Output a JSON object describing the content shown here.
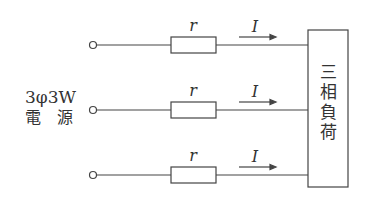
{
  "diagram": {
    "source_label_line1": "3φ3W",
    "source_label_line2": "電　源",
    "load_label": [
      "三",
      "相",
      "負",
      "荷"
    ],
    "lines": [
      {
        "resistor_label": "r",
        "current_label": "I"
      },
      {
        "resistor_label": "r",
        "current_label": "I"
      },
      {
        "resistor_label": "r",
        "current_label": "I"
      }
    ],
    "colors": {
      "stroke": "#444444",
      "text": "#333333",
      "background": "#ffffff"
    }
  }
}
